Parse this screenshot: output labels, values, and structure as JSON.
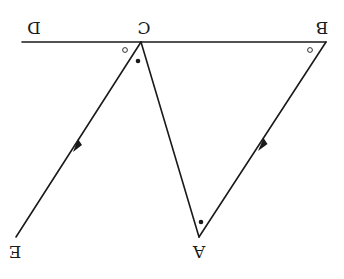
{
  "diagram": {
    "rotation_deg": 180,
    "points": {
      "D": {
        "label": "D",
        "x": 22,
        "y": 42
      },
      "C": {
        "label": "C",
        "x": 141,
        "y": 42
      },
      "B": {
        "label": "B",
        "x": 326,
        "y": 42
      },
      "A": {
        "label": "A",
        "x": 199,
        "y": 237
      },
      "E": {
        "label": "E",
        "x": 16,
        "y": 237
      }
    },
    "segments": [
      {
        "from": "D",
        "to": "B",
        "type": "line"
      },
      {
        "from": "C",
        "to": "A",
        "type": "segment"
      },
      {
        "from": "B",
        "to": "A",
        "type": "segment",
        "arrow": "towards A"
      },
      {
        "from": "C",
        "to": "E",
        "type": "ray",
        "arrow": "towards E"
      }
    ],
    "angle_marks": [
      {
        "vertex": "C",
        "mark": "open-circle",
        "between": "D-C-E"
      },
      {
        "vertex": "C",
        "mark": "filled-dot",
        "between": "E-C-A"
      },
      {
        "vertex": "B",
        "mark": "open-circle",
        "between": "C-B-A"
      },
      {
        "vertex": "A",
        "mark": "filled-dot",
        "between": "C-A-B"
      }
    ],
    "colors": {
      "ink": "#1a1a1a",
      "background": "#ffffff"
    }
  }
}
